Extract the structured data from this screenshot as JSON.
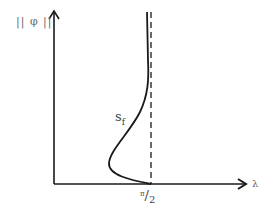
{
  "diagram": {
    "y_axis_label": "|| φ ||",
    "x_axis_label": "λ",
    "x_tick": {
      "numerator": "π",
      "denominator": "2"
    },
    "curve_label": {
      "main": "s",
      "sub": "f"
    },
    "colors": {
      "line": "#1a1a1a",
      "text": "#444444",
      "background": "#ffffff"
    }
  }
}
